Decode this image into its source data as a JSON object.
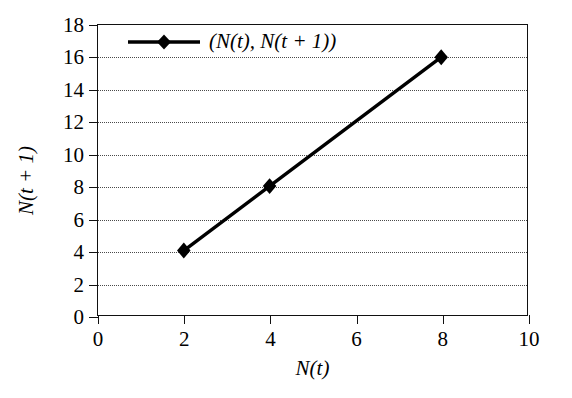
{
  "chart_data": {
    "type": "line",
    "title": "",
    "subtitle": "",
    "xlabel": "N(t)",
    "ylabel": "N(t + 1)",
    "xlim": [
      0,
      10
    ],
    "ylim": [
      0,
      18
    ],
    "xticks": [
      0,
      2,
      4,
      6,
      8,
      10
    ],
    "yticks": [
      0,
      2,
      4,
      6,
      8,
      10,
      12,
      14,
      16,
      18
    ],
    "xticklabels": [
      "0",
      "2",
      "4",
      "6",
      "8",
      "10"
    ],
    "yticklabels": [
      "0",
      "2",
      "4",
      "6",
      "8",
      "10",
      "12",
      "14",
      "16",
      "18"
    ],
    "grid": {
      "horizontal": true,
      "vertical": false,
      "style": "dotted"
    },
    "legend": {
      "position": "upper left",
      "frame": false
    },
    "series": [
      {
        "name": "(N(t), N(t + 1))",
        "x": [
          2,
          4,
          8
        ],
        "y": [
          4,
          8,
          16
        ],
        "points": [
          [
            2,
            4
          ],
          [
            4,
            8
          ],
          [
            8,
            16
          ]
        ],
        "color": "#000000",
        "marker": "diamond",
        "linewidth": 3
      }
    ]
  },
  "axes": {
    "x_title": "N(t)",
    "y_title": "N(t + 1)"
  },
  "legend": {
    "entries": [
      {
        "label": "(N(t), N(t + 1))",
        "marker": "diamond",
        "color": "#000000"
      }
    ]
  },
  "colors": {
    "background": "#ffffff",
    "frame": "#111111",
    "grid": "#4a4a4a",
    "series": "#000000"
  }
}
